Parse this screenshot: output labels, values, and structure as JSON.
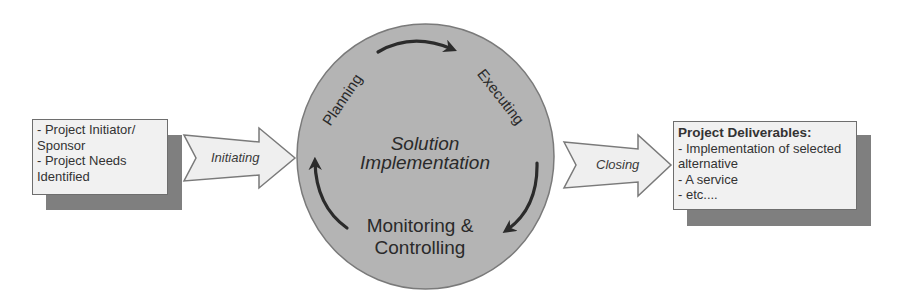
{
  "diagram": {
    "input_box": {
      "lines": [
        "- Project Initiator/",
        "Sponsor",
        "- Project Needs",
        "Identified"
      ]
    },
    "initiating_arrow": {
      "label": "Initiating"
    },
    "cycle": {
      "center_title": [
        "Solution",
        "Implementation"
      ],
      "phases": {
        "planning": "Planning",
        "executing": "Executing",
        "monitoring": [
          "Monitoring &",
          "Controlling"
        ]
      },
      "colors": {
        "circle_fill": "#b4b4b4",
        "circle_stroke": "#7a7a7a",
        "arrow": "#2b2b2b"
      }
    },
    "closing_arrow": {
      "label": "Closing"
    },
    "output_box": {
      "title": "Project Deliverables:",
      "lines": [
        "- Implementation of selected",
        "alternative",
        "- A service",
        "- etc...."
      ]
    },
    "colors": {
      "box_fill": "#f1f1f1",
      "box_shadow": "#7f7f7f",
      "arrow_fill": "#efefef",
      "outline": "#6e6e6e"
    }
  }
}
